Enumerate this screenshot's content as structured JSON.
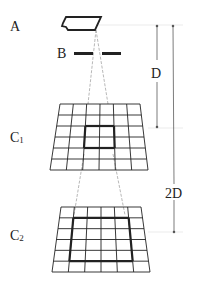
{
  "labels": {
    "a": "A",
    "b": "B",
    "c1_main": "C",
    "c1_sub": "1",
    "c2_main": "C",
    "c2_sub": "2",
    "d": "D",
    "two_d": "2D"
  },
  "colors": {
    "stroke": "#222222",
    "guide": "#cccccc",
    "ray": "#888888"
  },
  "grids": {
    "c1": {
      "rows": 6,
      "cols": 6,
      "highlight": "2x2 center"
    },
    "c2": {
      "rows": 6,
      "cols": 6,
      "highlight": "4x4 center"
    }
  }
}
